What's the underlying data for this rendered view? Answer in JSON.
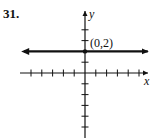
{
  "problem": {
    "number": "31."
  },
  "chart_data": {
    "type": "line",
    "title": "",
    "xlabel": "x",
    "ylabel": "y",
    "xlim": [
      -6,
      6
    ],
    "ylim": [
      -6,
      5.5
    ],
    "grid": false,
    "x_ticks": [
      -5,
      -4,
      -3,
      -2,
      -1,
      1,
      2,
      3,
      4,
      5
    ],
    "y_ticks": [
      -5,
      -4,
      -3,
      -2,
      -1,
      1,
      2,
      3,
      4
    ],
    "series": [
      {
        "name": "y = 2",
        "equation": "y = 2",
        "x": [
          -6,
          6
        ],
        "y": [
          2,
          2
        ],
        "arrows_both_ends": true
      }
    ],
    "points": [
      {
        "x": 0,
        "y": 2,
        "label": "(0,2)"
      }
    ],
    "annotations": [
      "(0,2)"
    ]
  },
  "labels": {
    "x_axis": "x",
    "y_axis": "y",
    "point": "(0,2)"
  },
  "colors": {
    "ink": "#111111",
    "background": "#ffffff"
  }
}
